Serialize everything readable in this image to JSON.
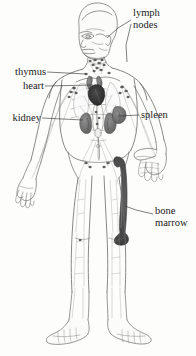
{
  "figure": {
    "type": "anatomical-diagram",
    "view": "anterior full-body",
    "style": "pencil line drawing, greyscale",
    "background_color": "#fdfdfc",
    "ink_color": "#5b5b5b",
    "label_color": "#1b1b1b"
  },
  "labels": [
    {
      "id": "lymph-nodes",
      "text_line1": "lymph",
      "text_line2": "nodes",
      "side": "right",
      "x": 133,
      "y": 8,
      "organ_color": "#6e6e6e"
    },
    {
      "id": "thymus",
      "text_line1": "thymus",
      "text_line2": "",
      "side": "left",
      "x": 8,
      "y": 68,
      "organ_color": "#7a7a7a"
    },
    {
      "id": "heart",
      "text_line1": "heart",
      "text_line2": "",
      "side": "left",
      "x": 20,
      "y": 82,
      "organ_color": "#3a3a3a"
    },
    {
      "id": "kidney",
      "text_line1": "kidney",
      "text_line2": "",
      "side": "left",
      "x": 5,
      "y": 114,
      "organ_color": "#777777"
    },
    {
      "id": "spleen",
      "text_line1": "spleen",
      "text_line2": "",
      "side": "right",
      "x": 140,
      "y": 110,
      "organ_color": "#6b6b6b"
    },
    {
      "id": "bone-marrow",
      "text_line1": "bone",
      "text_line2": "marrow",
      "side": "right",
      "x": 155,
      "y": 206,
      "organ_color": "#4a4a4a"
    }
  ],
  "leader_lines": [
    {
      "id": "leader-lymph-node-neck",
      "from": [
        133,
        20
      ],
      "to": [
        108,
        38
      ]
    },
    {
      "id": "leader-lymph-node-axilla",
      "from": [
        133,
        24
      ],
      "to": [
        128,
        62
      ]
    },
    {
      "id": "leader-thymus",
      "from": [
        48,
        72
      ],
      "to": [
        86,
        74
      ]
    },
    {
      "id": "leader-heart",
      "from": [
        48,
        86
      ],
      "to": [
        93,
        84
      ]
    },
    {
      "id": "leader-kidney",
      "from": [
        42,
        118
      ],
      "to": [
        83,
        120
      ]
    },
    {
      "id": "leader-spleen",
      "from": [
        138,
        115
      ],
      "to": [
        117,
        116
      ]
    },
    {
      "id": "leader-bone-marrow",
      "from": [
        152,
        214
      ],
      "to": [
        124,
        208
      ]
    }
  ]
}
